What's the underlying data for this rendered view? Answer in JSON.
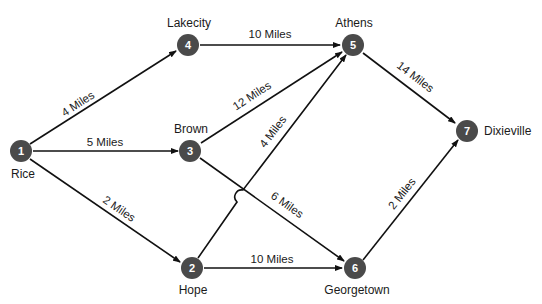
{
  "diagram": {
    "type": "network",
    "nodes": [
      {
        "id": "1",
        "name": "Rice"
      },
      {
        "id": "2",
        "name": "Hope"
      },
      {
        "id": "3",
        "name": "Brown"
      },
      {
        "id": "4",
        "name": "Lakecity"
      },
      {
        "id": "5",
        "name": "Athens"
      },
      {
        "id": "6",
        "name": "Georgetown"
      },
      {
        "id": "7",
        "name": "Dixieville"
      }
    ],
    "edges": [
      {
        "from": "1",
        "to": "4",
        "label": "4 Miles"
      },
      {
        "from": "1",
        "to": "3",
        "label": "5 Miles"
      },
      {
        "from": "1",
        "to": "2",
        "label": "2 Miles"
      },
      {
        "from": "4",
        "to": "5",
        "label": "10 Miles"
      },
      {
        "from": "3",
        "to": "5",
        "label": "12 Miles"
      },
      {
        "from": "2",
        "to": "5",
        "label": "4 Miles"
      },
      {
        "from": "3",
        "to": "6",
        "label": "6 Miles"
      },
      {
        "from": "2",
        "to": "6",
        "label": "10 Miles"
      },
      {
        "from": "5",
        "to": "7",
        "label": "14 Miles"
      },
      {
        "from": "6",
        "to": "7",
        "label": "2 Miles"
      }
    ],
    "colors": {
      "node": "#4a4a4a",
      "edge": "#111111",
      "text": "#1a1a1a"
    }
  }
}
